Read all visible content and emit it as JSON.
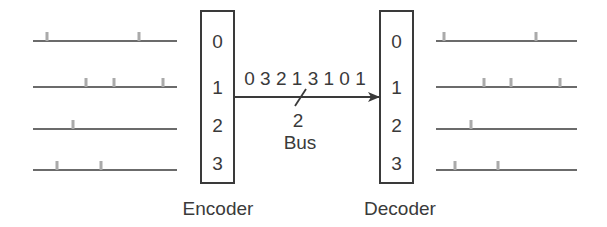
{
  "colors": {
    "line": "#3a3a3a",
    "pulse": "#aaaaaa",
    "text": "#3a3a3a",
    "background": "#ffffff"
  },
  "encoder": {
    "label": "Encoder",
    "box": {
      "x": 201,
      "y": 11,
      "w": 33,
      "h": 172
    },
    "ports": [
      "0",
      "1",
      "2",
      "3"
    ]
  },
  "decoder": {
    "label": "Decoder",
    "box": {
      "x": 380,
      "y": 11,
      "w": 33,
      "h": 172
    },
    "ports": [
      "0",
      "1",
      "2",
      "3"
    ]
  },
  "bus": {
    "label": "Bus",
    "width_label": "2",
    "sequence": [
      "0",
      "3",
      "2",
      "1",
      "3",
      "1",
      "0",
      "1"
    ],
    "sequence_text": "0 3 2 1 3 1 0 1",
    "y": 97,
    "x_start": 234,
    "x_end": 380
  },
  "input_lines": [
    {
      "port": "0",
      "y": 41,
      "x1": 33,
      "x2": 177,
      "pulses": [
        47,
        139
      ]
    },
    {
      "port": "1",
      "y": 87,
      "x1": 33,
      "x2": 177,
      "pulses": [
        86,
        114,
        163
      ]
    },
    {
      "port": "2",
      "y": 129,
      "x1": 33,
      "x2": 177,
      "pulses": [
        73
      ]
    },
    {
      "port": "3",
      "y": 170,
      "x1": 33,
      "x2": 177,
      "pulses": [
        57,
        101
      ]
    }
  ],
  "output_lines": [
    {
      "port": "0",
      "y": 41,
      "x1": 436,
      "x2": 577,
      "pulses": [
        444,
        536
      ]
    },
    {
      "port": "1",
      "y": 87,
      "x1": 436,
      "x2": 577,
      "pulses": [
        484,
        511,
        560
      ]
    },
    {
      "port": "2",
      "y": 129,
      "x1": 436,
      "x2": 577,
      "pulses": [
        471
      ]
    },
    {
      "port": "3",
      "y": 170,
      "x1": 436,
      "x2": 577,
      "pulses": [
        455,
        498
      ]
    }
  ]
}
